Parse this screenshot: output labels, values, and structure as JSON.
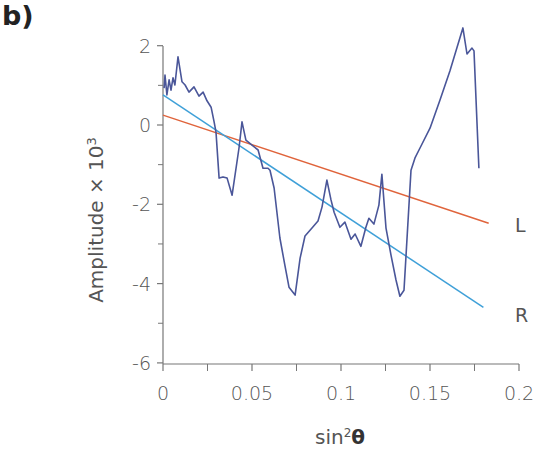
{
  "panel": {
    "label": "b)"
  },
  "colors": {
    "axis": "#777777",
    "data_line": "#4a5699",
    "fit_L": "#e0643c",
    "fit_R": "#3fa0d8",
    "text": "#555555"
  },
  "chart_data": {
    "type": "line",
    "title": "",
    "xlabel": "sin²θ",
    "xlabel_base": "sin",
    "xlabel_sup": "2",
    "xlabel_sym": "θ",
    "ylabel": "Amplitude × 10³",
    "ylabel_base": "Amplitude × 10",
    "ylabel_sup": "3",
    "xlim": [
      0,
      0.2
    ],
    "ylim": [
      -6,
      2.4
    ],
    "xticks": [
      0,
      0.05,
      0.1,
      0.15,
      0.2
    ],
    "xtick_labels": [
      "0",
      "0.05",
      "0.1",
      "0.15",
      "0.2"
    ],
    "xminor_ticks": [
      0.025,
      0.075,
      0.125,
      0.175
    ],
    "yticks": [
      2,
      0,
      -2,
      -4,
      -6
    ],
    "ytick_labels": [
      "2",
      "0",
      "-2",
      "-4",
      "-6"
    ],
    "yminor_ticks": [
      1,
      -1,
      -3,
      -5
    ],
    "grid": false,
    "legend": "inline labels at line ends",
    "series": [
      {
        "name": "data",
        "style": "line",
        "x": [
          0.0006,
          0.0011,
          0.0022,
          0.0034,
          0.0045,
          0.0056,
          0.0067,
          0.0084,
          0.0107,
          0.0124,
          0.0146,
          0.0174,
          0.0202,
          0.0225,
          0.0247,
          0.027,
          0.0287,
          0.0298,
          0.0315,
          0.0337,
          0.036,
          0.0388,
          0.0427,
          0.0444,
          0.0466,
          0.05,
          0.0534,
          0.0562,
          0.059,
          0.0601,
          0.0624,
          0.0657,
          0.0685,
          0.0708,
          0.0742,
          0.077,
          0.0798,
          0.0831,
          0.0871,
          0.0893,
          0.0921,
          0.0944,
          0.0961,
          0.0994,
          0.1022,
          0.1056,
          0.1079,
          0.1112,
          0.114,
          0.1157,
          0.1185,
          0.1213,
          0.123,
          0.1253,
          0.1281,
          0.1309,
          0.1331,
          0.1354,
          0.1393,
          0.1416,
          0.1444,
          0.15,
          0.1556,
          0.1612,
          0.1685,
          0.1708,
          0.1736,
          0.1747,
          0.1764,
          0.1775
        ],
        "y": [
          0.93,
          1.26,
          0.76,
          1.14,
          0.88,
          1.19,
          1.01,
          1.72,
          1.09,
          1.01,
          0.83,
          0.96,
          0.73,
          0.83,
          0.61,
          0.45,
          0.08,
          -0.18,
          -1.34,
          -1.31,
          -1.34,
          -1.77,
          -0.58,
          0.08,
          -0.38,
          -0.51,
          -0.63,
          -1.09,
          -1.09,
          -1.14,
          -1.59,
          -2.85,
          -3.54,
          -4.09,
          -4.29,
          -3.36,
          -2.8,
          -2.63,
          -2.42,
          -2.07,
          -1.39,
          -1.89,
          -2.2,
          -2.58,
          -2.45,
          -2.88,
          -2.75,
          -3.06,
          -2.58,
          -2.35,
          -2.5,
          -2.02,
          -1.24,
          -2.6,
          -3.28,
          -3.91,
          -4.32,
          -4.17,
          -1.14,
          -0.83,
          -0.58,
          -0.08,
          0.63,
          1.36,
          2.45,
          1.79,
          1.94,
          1.87,
          0.05,
          -1.09
        ]
      },
      {
        "name": "L",
        "style": "linear fit",
        "x": [
          0,
          0.183
        ],
        "y": [
          0.25,
          -2.48
        ]
      },
      {
        "name": "R",
        "style": "linear fit",
        "x": [
          0,
          0.18
        ],
        "y": [
          0.76,
          -4.6
        ]
      }
    ]
  }
}
